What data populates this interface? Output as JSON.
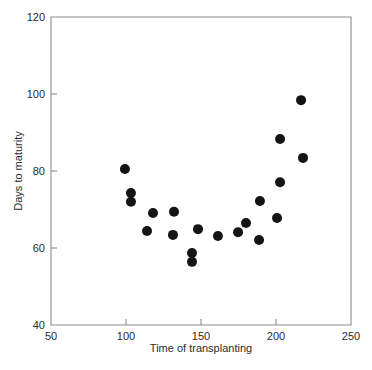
{
  "chart_data": {
    "type": "scatter",
    "title": "",
    "xlabel": "Time of transplanting",
    "ylabel": "Days to maturity",
    "xlim": [
      50,
      250
    ],
    "ylim": [
      40,
      120
    ],
    "xticks": [
      50,
      100,
      150,
      200,
      250
    ],
    "yticks": [
      40,
      60,
      80,
      100,
      120
    ],
    "xtick_labels": [
      "50",
      "100",
      "150",
      "200",
      "250"
    ],
    "ytick_labels": [
      "40",
      "60",
      "80",
      "100",
      "120"
    ],
    "grid": false,
    "legend": false,
    "legend_position": "none",
    "marker": "circle",
    "marker_color": "#141414",
    "marker_size": 5,
    "frame": "box",
    "points": [
      {
        "x": 99.3,
        "y": 80.5
      },
      {
        "x": 103.3,
        "y": 74.3
      },
      {
        "x": 103.3,
        "y": 72.0
      },
      {
        "x": 114.0,
        "y": 64.4
      },
      {
        "x": 118.0,
        "y": 69.1
      },
      {
        "x": 131.3,
        "y": 63.4
      },
      {
        "x": 132.0,
        "y": 69.4
      },
      {
        "x": 144.0,
        "y": 58.7
      },
      {
        "x": 144.0,
        "y": 56.4
      },
      {
        "x": 148.0,
        "y": 64.9
      },
      {
        "x": 161.3,
        "y": 63.1
      },
      {
        "x": 174.7,
        "y": 64.1
      },
      {
        "x": 180.0,
        "y": 66.5
      },
      {
        "x": 188.7,
        "y": 62.1
      },
      {
        "x": 189.3,
        "y": 72.2
      },
      {
        "x": 200.7,
        "y": 67.8
      },
      {
        "x": 202.7,
        "y": 77.1
      },
      {
        "x": 202.7,
        "y": 88.3
      },
      {
        "x": 216.7,
        "y": 98.4
      },
      {
        "x": 218.0,
        "y": 83.4
      }
    ]
  },
  "colors": {
    "background": "#ffffff",
    "axis": "#8b8b8b",
    "text": "#2b2b2b",
    "marker": "#141414"
  }
}
